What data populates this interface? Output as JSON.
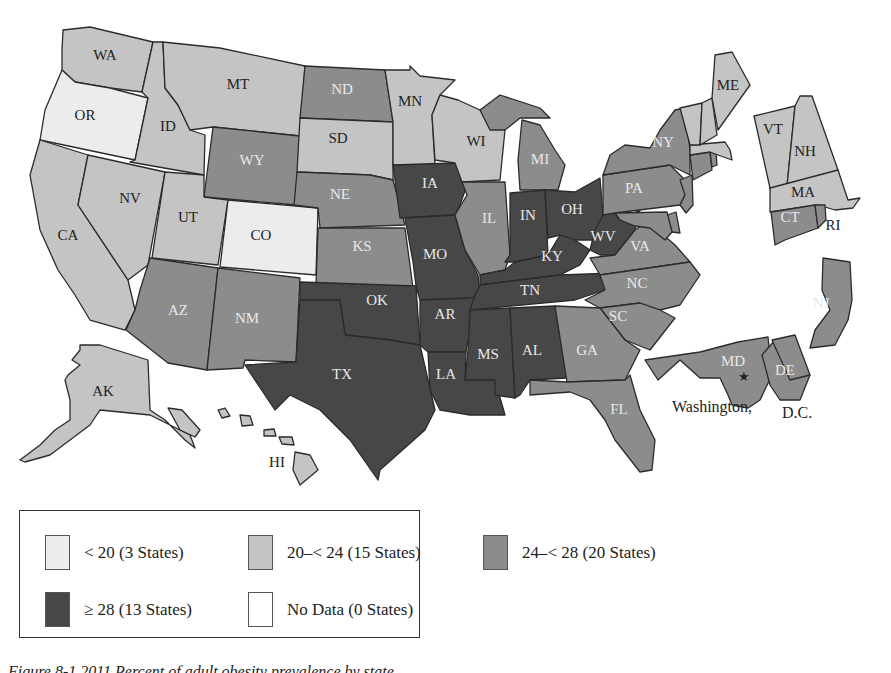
{
  "colors": {
    "lt20": "#ececec",
    "20to24": "#c4c4c4",
    "24to28": "#8c8c8c",
    "gte28": "#474747",
    "nodata": "#ffffff"
  },
  "legend": {
    "items": [
      {
        "key": "lt20",
        "label": "< 20 (3 States)",
        "color": "#ececec"
      },
      {
        "key": "20to24",
        "label": "20–< 24 (15 States)",
        "color": "#c4c4c4"
      },
      {
        "key": "24to28",
        "label": "24–< 28 (20 States)",
        "color": "#8c8c8c"
      },
      {
        "key": "gte28",
        "label": "≥ 28 (13 States)",
        "color": "#474747"
      },
      {
        "key": "nodata",
        "label": "No Data (0 States)",
        "color": "#ffffff"
      }
    ]
  },
  "states": {
    "WA": {
      "label": "WA",
      "category": "20to24"
    },
    "OR": {
      "label": "OR",
      "category": "lt20"
    },
    "CA": {
      "label": "CA",
      "category": "20to24"
    },
    "ID": {
      "label": "ID",
      "category": "20to24"
    },
    "NV": {
      "label": "NV",
      "category": "20to24"
    },
    "MT": {
      "label": "MT",
      "category": "20to24"
    },
    "WY": {
      "label": "WY",
      "category": "24to28"
    },
    "UT": {
      "label": "UT",
      "category": "20to24"
    },
    "CO": {
      "label": "CO",
      "category": "lt20"
    },
    "AZ": {
      "label": "AZ",
      "category": "24to28"
    },
    "NM": {
      "label": "NM",
      "category": "24to28"
    },
    "ND": {
      "label": "ND",
      "category": "24to28"
    },
    "SD": {
      "label": "SD",
      "category": "20to24"
    },
    "NE": {
      "label": "NE",
      "category": "24to28"
    },
    "KS": {
      "label": "KS",
      "category": "24to28"
    },
    "OK": {
      "label": "OK",
      "category": "gte28"
    },
    "TX": {
      "label": "TX",
      "category": "gte28"
    },
    "MN": {
      "label": "MN",
      "category": "20to24"
    },
    "IA": {
      "label": "IA",
      "category": "gte28"
    },
    "MO": {
      "label": "MO",
      "category": "gte28"
    },
    "AR": {
      "label": "AR",
      "category": "gte28"
    },
    "LA": {
      "label": "LA",
      "category": "gte28"
    },
    "WI": {
      "label": "WI",
      "category": "20to24"
    },
    "IL": {
      "label": "IL",
      "category": "24to28"
    },
    "MI": {
      "label": "MI",
      "category": "24to28"
    },
    "IN": {
      "label": "IN",
      "category": "gte28"
    },
    "OH": {
      "label": "OH",
      "category": "gte28"
    },
    "KY": {
      "label": "KY",
      "category": "gte28"
    },
    "TN": {
      "label": "TN",
      "category": "gte28"
    },
    "MS": {
      "label": "MS",
      "category": "gte28"
    },
    "AL": {
      "label": "AL",
      "category": "gte28"
    },
    "WV": {
      "label": "WV",
      "category": "gte28"
    },
    "VA": {
      "label": "VA",
      "category": "24to28"
    },
    "NC": {
      "label": "NC",
      "category": "24to28"
    },
    "SC": {
      "label": "SC",
      "category": "24to28"
    },
    "GA": {
      "label": "GA",
      "category": "24to28"
    },
    "FL": {
      "label": "FL",
      "category": "24to28"
    },
    "PA": {
      "label": "PA",
      "category": "24to28"
    },
    "NY": {
      "label": "NY",
      "category": "24to28"
    },
    "NJ": {
      "label": "NJ",
      "category": "24to28"
    },
    "DE": {
      "label": "DE",
      "category": "24to28"
    },
    "MD": {
      "label": "MD",
      "category": "24to28"
    },
    "CT": {
      "label": "CT",
      "category": "24to28"
    },
    "RI": {
      "label": "RI",
      "category": "24to28"
    },
    "MA": {
      "label": "MA",
      "category": "20to24"
    },
    "VT": {
      "label": "VT",
      "category": "20to24"
    },
    "NH": {
      "label": "NH",
      "category": "20to24"
    },
    "ME": {
      "label": "ME",
      "category": "20to24"
    },
    "AK": {
      "label": "AK",
      "category": "20to24"
    },
    "HI": {
      "label": "HI",
      "category": "20to24"
    }
  },
  "annotations": {
    "dc_left": "Washington,",
    "dc_right": "D.C.",
    "dc_marker": "★"
  },
  "caption": "Figure 8-1 2011 Percent of adult obesity prevalence by state"
}
